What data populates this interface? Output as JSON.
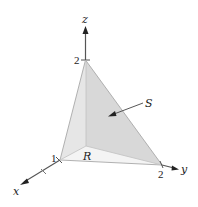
{
  "figure": {
    "axes": {
      "x": {
        "label": "x",
        "tick_label": "1"
      },
      "y": {
        "label": "y",
        "tick_label": "2"
      },
      "z": {
        "label": "z",
        "tick_label": "2"
      }
    },
    "surface_label": "S",
    "region_label": "R"
  },
  "colors": {
    "surface_face": "#d9d9d9",
    "side_face": "#e8e8e8",
    "base_region": "#f3f3f3",
    "edge": "#9a9a9a",
    "axis": "#555555",
    "text": "#222222"
  }
}
